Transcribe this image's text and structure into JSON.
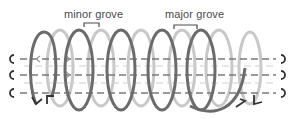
{
  "diagram": {
    "labels": {
      "minor_groove": "minor grove",
      "major_groove": "major grove"
    },
    "colors": {
      "front_strand": "#6b6b6b",
      "back_strand": "#c8c8c8",
      "axis_lines": "#7a7a7a",
      "label_text": "#4a4a4a"
    },
    "strand_lines": 3,
    "end_marker_left": "C",
    "end_marker_right": "Ɔ"
  }
}
